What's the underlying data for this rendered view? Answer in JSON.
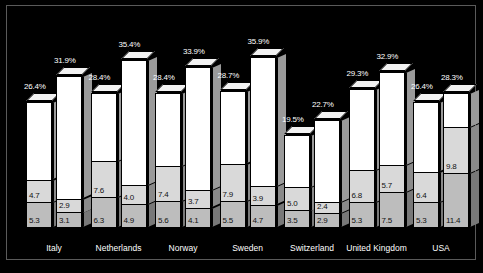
{
  "chart_data": {
    "type": "bar",
    "subtype": "stacked-3d-column",
    "title": "",
    "xlabel": "",
    "ylabel": "",
    "ylim": [
      0,
      36
    ],
    "grid": false,
    "legend": "none",
    "categories": [
      "Italy",
      "Netherlands",
      "Norway",
      "Sweden",
      "Switzerland",
      "United Kingdom",
      "USA"
    ],
    "bars": [
      {
        "category": "Italy",
        "index": 0,
        "total_label": "26.4%",
        "total": 26.4,
        "segments": [
          {
            "name": "top",
            "shade": "white",
            "value": null,
            "label": ""
          },
          {
            "name": "middle",
            "shade": "lgray",
            "value": 4.7,
            "label": "4.7"
          },
          {
            "name": "bottom",
            "shade": "dgray",
            "value": 5.3,
            "label": "5.3"
          }
        ]
      },
      {
        "category": "Italy",
        "index": 1,
        "total_label": "31.9%",
        "total": 31.9,
        "segments": [
          {
            "name": "top",
            "shade": "white",
            "value": null,
            "label": ""
          },
          {
            "name": "middle",
            "shade": "lgray",
            "value": 2.9,
            "label": "2.9"
          },
          {
            "name": "bottom",
            "shade": "dgray",
            "value": 3.1,
            "label": "3.1"
          }
        ]
      },
      {
        "category": "Netherlands",
        "index": 0,
        "total_label": "28.4%",
        "total": 28.4,
        "segments": [
          {
            "name": "top",
            "shade": "white",
            "value": null,
            "label": ""
          },
          {
            "name": "middle",
            "shade": "lgray",
            "value": 7.6,
            "label": "7.6"
          },
          {
            "name": "bottom",
            "shade": "dgray",
            "value": 6.3,
            "label": "6.3"
          }
        ]
      },
      {
        "category": "Netherlands",
        "index": 1,
        "total_label": "35.4%",
        "total": 35.4,
        "segments": [
          {
            "name": "top",
            "shade": "white",
            "value": null,
            "label": ""
          },
          {
            "name": "middle",
            "shade": "lgray",
            "value": 4.0,
            "label": "4.0"
          },
          {
            "name": "bottom",
            "shade": "dgray",
            "value": 4.9,
            "label": "4.9"
          }
        ]
      },
      {
        "category": "Norway",
        "index": 0,
        "total_label": "28.4%",
        "total": 28.4,
        "segments": [
          {
            "name": "top",
            "shade": "white",
            "value": null,
            "label": ""
          },
          {
            "name": "middle",
            "shade": "lgray",
            "value": 7.4,
            "label": "7.4"
          },
          {
            "name": "bottom",
            "shade": "dgray",
            "value": 5.6,
            "label": "5.6"
          }
        ]
      },
      {
        "category": "Norway",
        "index": 1,
        "total_label": "33.9%",
        "total": 33.9,
        "segments": [
          {
            "name": "top",
            "shade": "white",
            "value": null,
            "label": ""
          },
          {
            "name": "middle",
            "shade": "lgray",
            "value": 3.7,
            "label": "3.7"
          },
          {
            "name": "bottom",
            "shade": "dgray",
            "value": 4.1,
            "label": "4.1"
          }
        ]
      },
      {
        "category": "Sweden",
        "index": 0,
        "total_label": "28.7%",
        "total": 28.7,
        "segments": [
          {
            "name": "top",
            "shade": "white",
            "value": null,
            "label": ""
          },
          {
            "name": "middle",
            "shade": "lgray",
            "value": 7.9,
            "label": "7.9"
          },
          {
            "name": "bottom",
            "shade": "dgray",
            "value": 5.5,
            "label": "5.5"
          }
        ]
      },
      {
        "category": "Sweden",
        "index": 1,
        "total_label": "35.9%",
        "total": 35.9,
        "segments": [
          {
            "name": "top",
            "shade": "white",
            "value": null,
            "label": ""
          },
          {
            "name": "middle",
            "shade": "lgray",
            "value": 3.9,
            "label": "3.9"
          },
          {
            "name": "bottom",
            "shade": "dgray",
            "value": 4.7,
            "label": "4.7"
          }
        ]
      },
      {
        "category": "Switzerland",
        "index": 0,
        "total_label": "19.5%",
        "total": 19.5,
        "segments": [
          {
            "name": "top",
            "shade": "white",
            "value": null,
            "label": ""
          },
          {
            "name": "middle",
            "shade": "lgray",
            "value": 5.0,
            "label": "5.0"
          },
          {
            "name": "bottom",
            "shade": "dgray",
            "value": 3.5,
            "label": "3.5"
          }
        ]
      },
      {
        "category": "Switzerland",
        "index": 1,
        "total_label": "22.7%",
        "total": 22.7,
        "segments": [
          {
            "name": "top",
            "shade": "white",
            "value": null,
            "label": ""
          },
          {
            "name": "middle",
            "shade": "lgray",
            "value": 2.4,
            "label": "2.4"
          },
          {
            "name": "bottom",
            "shade": "dgray",
            "value": 2.9,
            "label": "2.9"
          }
        ]
      },
      {
        "category": "United Kingdom",
        "index": 0,
        "total_label": "29.3%",
        "total": 29.3,
        "segments": [
          {
            "name": "top",
            "shade": "white",
            "value": null,
            "label": ""
          },
          {
            "name": "middle",
            "shade": "lgray",
            "value": 6.8,
            "label": "6.8"
          },
          {
            "name": "bottom",
            "shade": "dgray",
            "value": 5.3,
            "label": "5.3"
          }
        ]
      },
      {
        "category": "United Kingdom",
        "index": 1,
        "total_label": "32.9%",
        "total": 32.9,
        "segments": [
          {
            "name": "top",
            "shade": "white",
            "value": null,
            "label": ""
          },
          {
            "name": "middle",
            "shade": "lgray",
            "value": 5.7,
            "label": "5.7"
          },
          {
            "name": "bottom",
            "shade": "dgray",
            "value": 7.5,
            "label": "7.5"
          }
        ]
      },
      {
        "category": "USA",
        "index": 0,
        "total_label": "26.4%",
        "total": 26.4,
        "segments": [
          {
            "name": "top",
            "shade": "white",
            "value": null,
            "label": ""
          },
          {
            "name": "middle",
            "shade": "lgray",
            "value": 6.4,
            "label": "6.4"
          },
          {
            "name": "bottom",
            "shade": "dgray",
            "value": 5.3,
            "label": "5.3"
          }
        ]
      },
      {
        "category": "USA",
        "index": 1,
        "total_label": "28.3%",
        "total": 28.3,
        "segments": [
          {
            "name": "top",
            "shade": "white",
            "value": null,
            "label": ""
          },
          {
            "name": "middle",
            "shade": "lgray",
            "value": 9.8,
            "label": "9.8"
          },
          {
            "name": "bottom",
            "shade": "dgray",
            "value": 11.4,
            "label": "11.4"
          }
        ]
      }
    ],
    "colors": {
      "background": "#000000",
      "top_segment": "#ffffff",
      "middle_segment": "#d9d9d9",
      "bottom_segment": "#bdbdbd",
      "label_text": "#ffffff",
      "value_text": "#111111",
      "frame": "#5a5a5a"
    }
  }
}
